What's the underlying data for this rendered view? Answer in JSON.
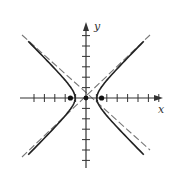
{
  "figure": {
    "type": "hyperbola",
    "equation_form": "x^2/a^2 - y^2/b^2 = 1",
    "axis_labels": {
      "x": "x",
      "y": "y"
    },
    "origin_px": [
      86,
      98
    ],
    "unit_px": 10.4,
    "x_ticks": [
      -5,
      -4,
      -3,
      -2,
      -1,
      1,
      2,
      3,
      4,
      5,
      6,
      7
    ],
    "y_ticks": [
      -6,
      -5,
      -4,
      -3,
      -2,
      -1,
      1,
      2,
      3,
      4,
      5,
      6
    ],
    "vertices": [
      [
        -1.05,
        0
      ],
      [
        1.05,
        0
      ]
    ],
    "foci": [
      [
        -1.5,
        0
      ],
      [
        1.5,
        0
      ]
    ],
    "center": [
      0,
      0
    ],
    "asymptote_slope": 1,
    "colors": {
      "axis": "#333333",
      "curve": "#222222",
      "asymptote": "#777777",
      "point": "#111111"
    }
  }
}
